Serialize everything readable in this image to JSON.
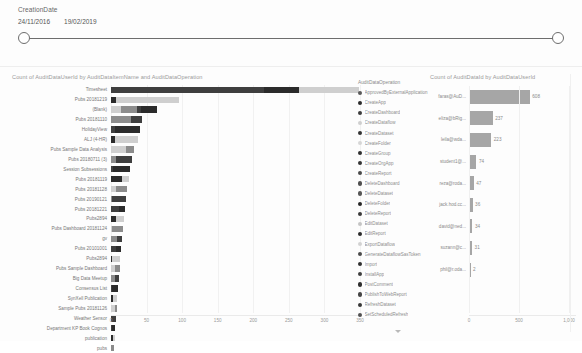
{
  "slicer": {
    "name": "CreationDate",
    "start_date": "24/11/2016",
    "end_date": "19/02/2019"
  },
  "left_chart": {
    "title": "Count of AuditDataUserId by AuditDataItemName and AuditDataOperation"
  },
  "right_chart": {
    "title": "Count of AuditDataId by AuditDataUserId"
  },
  "legend": {
    "title": "AuditDataOperation",
    "items": [
      {
        "label": "ApprovedByExternalApplication",
        "color": "#5a5a5a"
      },
      {
        "label": "CreateApp",
        "color": "#2b2b2b"
      },
      {
        "label": "CreateDashboard",
        "color": "#3d3d3d"
      },
      {
        "label": "CreateDataflow",
        "color": "#cfcfcf"
      },
      {
        "label": "CreateDataset",
        "color": "#333333"
      },
      {
        "label": "CreateFolder",
        "color": "#d6d6d6"
      },
      {
        "label": "CreateGroup",
        "color": "#2f2f2f"
      },
      {
        "label": "CreateOrgApp",
        "color": "#353535"
      },
      {
        "label": "CreateReport",
        "color": "#4a4a4a"
      },
      {
        "label": "DeleteDashboard",
        "color": "#4f4f4f"
      },
      {
        "label": "DeleteDataset",
        "color": "#565656"
      },
      {
        "label": "DeleteFolder",
        "color": "#262626"
      },
      {
        "label": "DeleteReport",
        "color": "#3a3a3a"
      },
      {
        "label": "EditDataset",
        "color": "#c4c4c4"
      },
      {
        "label": "EditReport",
        "color": "#2a2a2a"
      },
      {
        "label": "ExportDataflow",
        "color": "#d2d2d2"
      },
      {
        "label": "GenerateDataflowSasToken",
        "color": "#4b4b4b"
      },
      {
        "label": "Import",
        "color": "#303030"
      },
      {
        "label": "InstallApp",
        "color": "#3f3f3f"
      },
      {
        "label": "PostComment",
        "color": "#2e2e2e"
      },
      {
        "label": "PublishToWebReport",
        "color": "#454545"
      },
      {
        "label": "RefreshDataset",
        "color": "#383838"
      },
      {
        "label": "SetScheduledRefresh",
        "color": "#525252"
      }
    ]
  },
  "chart_data": [
    {
      "type": "bar",
      "orientation": "horizontal",
      "stacked": true,
      "title": "Count of AuditDataUserId by AuditDataItemName and AuditDataOperation",
      "xlabel": "",
      "ylabel": "AuditDataItemName",
      "xlim": [
        0,
        350
      ],
      "xticks": [
        "0",
        "50",
        "100",
        "150",
        "200",
        "250",
        "300",
        "350"
      ],
      "grid": true,
      "legend_position": "right",
      "categories": [
        "Timesheet",
        "Pubs 20181219",
        "(Blank)",
        "Pubs 20181110",
        "HolidayView",
        "ALJ (4-HR)",
        "Pubs Sample Data Analysis",
        "Pubs 20180711 (3)",
        "Session Subsessions",
        "Pubs 20181119",
        "Pubs 20181128",
        "Pubs 20190121",
        "Pubs 20181221",
        "Pubs2894",
        "Pubs Dashboard 20181124",
        "gv",
        "Pubs 20101001",
        "Pubs2894",
        "Pubs Sample Dashboard",
        "Big Data Meetup",
        "Consensus List",
        "SynXell Publication",
        "Sample Pubs 20181126",
        "Weather Sensor",
        "Department KP Book Cognos",
        "publication",
        "pubs"
      ],
      "values": [
        348,
        95,
        64,
        44,
        41,
        38,
        33,
        30,
        27,
        25,
        23,
        21,
        19,
        18,
        17,
        16,
        14,
        13,
        12,
        11,
        10,
        9,
        8,
        7,
        6,
        5,
        4
      ],
      "series": [
        {
          "name": "CreateReport",
          "color": "#3f3f3f"
        },
        {
          "name": "CreateDataset",
          "color": "#2b2b2b"
        },
        {
          "name": "CreateFolder",
          "color": "#cfcfcf"
        },
        {
          "name": "EditDataset",
          "color": "#8c8c8c"
        }
      ]
    },
    {
      "type": "bar",
      "orientation": "horizontal",
      "title": "Count of AuditDataId by AuditDataUserId",
      "xlabel": "",
      "ylabel": "AuditDataUserId",
      "xlim": [
        0,
        1000
      ],
      "xticks": [
        "0",
        "500",
        "1,000"
      ],
      "grid": true,
      "bar_color": "#a6a6a6",
      "categories": [
        "faras@AuD...",
        "eliza@bRig...",
        "leila@wda...",
        "student1@...",
        "reza@roda...",
        "jack.hod.cc...",
        "david@ned...",
        "suzann@c...",
        "phil@r.oda..."
      ],
      "values": [
        608,
        237,
        223,
        74,
        47,
        36,
        34,
        31,
        2
      ],
      "value_labels": [
        "608",
        "237",
        "223",
        "74",
        "47",
        "36",
        "34",
        "31",
        "2"
      ]
    }
  ]
}
